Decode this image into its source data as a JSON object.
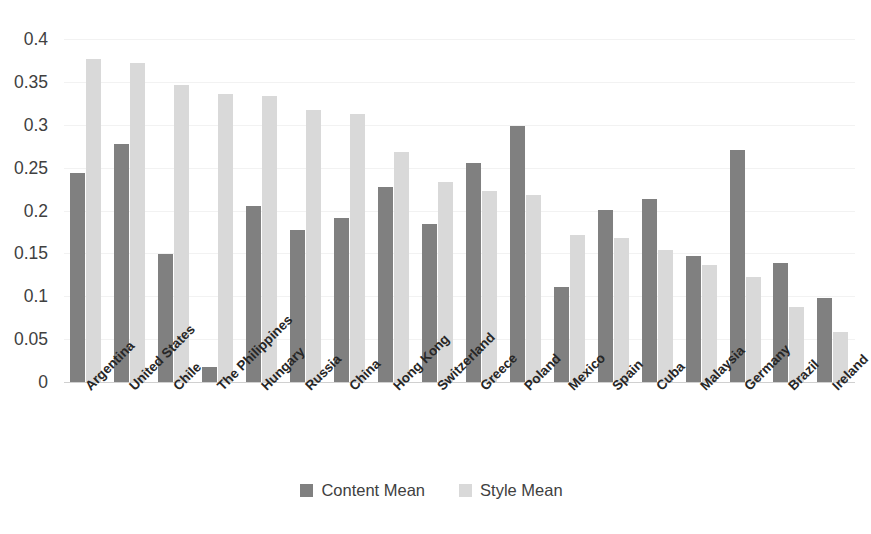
{
  "chart_data": {
    "type": "bar",
    "title": "",
    "xlabel": "",
    "ylabel": "",
    "ylim": [
      0,
      0.4
    ],
    "yticks": [
      "0",
      "0.05",
      "0.1",
      "0.15",
      "0.2",
      "0.25",
      "0.3",
      "0.35",
      "0.4"
    ],
    "ytick_values": [
      0,
      0.05,
      0.1,
      0.15,
      0.2,
      0.25,
      0.3,
      0.35,
      0.4
    ],
    "grid": true,
    "legend_position": "bottom",
    "categories": [
      "Argentina",
      "United States",
      "Chile",
      "The Philippines",
      "Hungary",
      "Russia",
      "China",
      "Hong Kong",
      "Switzerland",
      "Greece",
      "Poland",
      "Mexico",
      "Spain",
      "Cuba",
      "Malaysia",
      "Germany",
      "Brazil",
      "Ireland"
    ],
    "series": [
      {
        "name": "Content Mean",
        "color": "#808080",
        "values": [
          0.244,
          0.278,
          0.149,
          0.018,
          0.205,
          0.177,
          0.191,
          0.228,
          0.184,
          0.255,
          0.299,
          0.111,
          0.201,
          0.214,
          0.147,
          0.271,
          0.139,
          0.098
        ]
      },
      {
        "name": "Style Mean",
        "color": "#d9d9d9",
        "values": [
          0.377,
          0.372,
          0.346,
          0.336,
          0.334,
          0.317,
          0.313,
          0.268,
          0.233,
          0.223,
          0.218,
          0.172,
          0.168,
          0.154,
          0.137,
          0.122,
          0.087,
          0.058
        ]
      }
    ]
  },
  "legend": {
    "items": [
      {
        "label": "Content Mean",
        "color": "#808080"
      },
      {
        "label": "Style Mean",
        "color": "#d9d9d9"
      }
    ]
  }
}
